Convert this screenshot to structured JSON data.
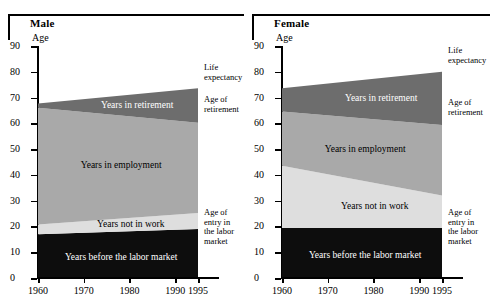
{
  "chart_data": [
    {
      "type": "area",
      "title": "Male",
      "xlabel": "",
      "ylabel": "Age",
      "x": [
        1960,
        1995
      ],
      "xlim": [
        1960,
        1995
      ],
      "ylim": [
        0,
        90
      ],
      "xticks": [
        1960,
        1970,
        1980,
        1990,
        1995
      ],
      "yticks": [
        0,
        10,
        20,
        30,
        40,
        50,
        60,
        70,
        80,
        90
      ],
      "grid": false,
      "legend": "in-band labels",
      "series": [
        {
          "name": "Years before the labor market",
          "boundary_name": "Age of entry in the labor market",
          "values": [
            17.0,
            19.0
          ],
          "color": "#0d0d0d"
        },
        {
          "name": "Years not in work",
          "boundary_name": "Start of employment",
          "values": [
            20.8,
            25.2
          ],
          "color": "#dedede"
        },
        {
          "name": "Years in employment",
          "boundary_name": "Age of retirement",
          "values": [
            66.0,
            60.2
          ],
          "color": "#a9a9a9"
        },
        {
          "name": "Years in retirement",
          "boundary_name": "Life expectancy",
          "values": [
            67.7,
            73.6
          ],
          "color": "#6d6d6d"
        }
      ],
      "annotations": [
        {
          "text": "Life expectancy",
          "at_year": 1995,
          "at_value": 73.6
        },
        {
          "text": "Age of retirement",
          "at_year": 1995,
          "at_value": 60.2
        },
        {
          "text": "Age of entry in the labor market",
          "at_year": 1995,
          "at_value": 19.0
        }
      ]
    },
    {
      "type": "area",
      "title": "Female",
      "xlabel": "",
      "ylabel": "Age",
      "x": [
        1960,
        1995
      ],
      "xlim": [
        1960,
        1995
      ],
      "ylim": [
        0,
        90
      ],
      "xticks": [
        1960,
        1970,
        1980,
        1990,
        1995
      ],
      "yticks": [
        0,
        10,
        20,
        30,
        40,
        50,
        60,
        70,
        80,
        90
      ],
      "grid": false,
      "legend": "in-band labels",
      "series": [
        {
          "name": "Years before the labor market",
          "boundary_name": "Age of entry in the labor market",
          "values": [
            19.4,
            19.4
          ],
          "color": "#0d0d0d"
        },
        {
          "name": "Years not in work",
          "boundary_name": "Start of employment",
          "values": [
            43.5,
            32.0
          ],
          "color": "#dedede"
        },
        {
          "name": "Years in employment",
          "boundary_name": "Age of retirement",
          "values": [
            64.6,
            59.4
          ],
          "color": "#a9a9a9"
        },
        {
          "name": "Years in retirement",
          "boundary_name": "Life expectancy",
          "values": [
            73.6,
            80.0
          ],
          "color": "#6d6d6d"
        }
      ],
      "annotations": [
        {
          "text": "Life expectancy",
          "at_year": 1995,
          "at_value": 80.0
        },
        {
          "text": "Age of retirement",
          "at_year": 1995,
          "at_value": 59.4
        },
        {
          "text": "Age of entry in the labor market",
          "at_year": 1995,
          "at_value": 19.4
        }
      ]
    }
  ],
  "panels": {
    "male": {
      "title": "Male",
      "axis_name": "Age",
      "annotations": {
        "life_expectancy_l1": "Life",
        "life_expectancy_l2": "expectancy",
        "retirement_l1": "Age of",
        "retirement_l2": "retirement",
        "entry_l1": "Age of",
        "entry_l2": "entry in",
        "entry_l3": "the labor",
        "entry_l4": "market"
      },
      "band_labels": {
        "retirement": "Years in retirement",
        "employment": "Years in employment",
        "not_in_work": "Years not in work",
        "before_market": "Years before the labor market"
      }
    },
    "female": {
      "title": "Female",
      "axis_name": "Age",
      "annotations": {
        "life_expectancy_l1": "Life",
        "life_expectancy_l2": "expectancy",
        "retirement_l1": "Age of",
        "retirement_l2": "retirement",
        "entry_l1": "Age of",
        "entry_l2": "entry in",
        "entry_l3": "the labor",
        "entry_l4": "market"
      },
      "band_labels": {
        "retirement": "Years in retirement",
        "employment": "Years in employment",
        "not_in_work": "Years not in work",
        "before_market": "Years before the labor market"
      }
    }
  },
  "colors": {
    "retirement": "#6d6d6d",
    "employment": "#a9a9a9",
    "not_in_work": "#dedede",
    "before_market": "#0d0d0d",
    "axis": "#000000"
  }
}
